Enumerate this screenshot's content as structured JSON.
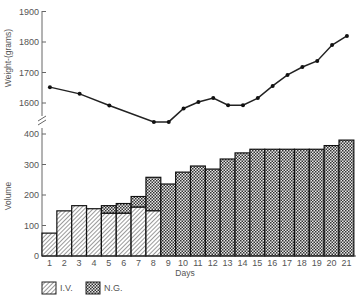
{
  "chart_data": [
    {
      "type": "line",
      "title": "",
      "xlabel": "Days",
      "ylabel": "Weight (grams)",
      "ylim": [
        1500,
        1900
      ],
      "y_ticks": [
        1600,
        1700,
        1800,
        1900
      ],
      "x": [
        1,
        3,
        5,
        8,
        9,
        10,
        11,
        12,
        13,
        14,
        15,
        16,
        17,
        18,
        19,
        20,
        21
      ],
      "values": [
        1652,
        1630,
        1592,
        1538,
        1538,
        1582,
        1603,
        1616,
        1593,
        1593,
        1616,
        1656,
        1692,
        1718,
        1738,
        1790,
        1820
      ],
      "axis_break": true,
      "grid": false
    },
    {
      "type": "bar",
      "stacked": true,
      "title": "",
      "xlabel": "Days",
      "ylabel": "Volume",
      "ylim": [
        0,
        400
      ],
      "y_ticks": [
        0,
        100,
        200,
        300,
        400
      ],
      "categories": [
        "1",
        "2",
        "3",
        "4",
        "5",
        "6",
        "7",
        "8",
        "9",
        "10",
        "11",
        "12",
        "13",
        "14",
        "15",
        "16",
        "17",
        "18",
        "19",
        "20",
        "21"
      ],
      "series": [
        {
          "name": "I.V.",
          "pattern": "diagonal-hatch",
          "values": [
            75,
            148,
            165,
            155,
            140,
            140,
            160,
            148,
            0,
            0,
            0,
            0,
            0,
            0,
            0,
            0,
            0,
            0,
            0,
            0,
            0
          ]
        },
        {
          "name": "N.G.",
          "pattern": "checker",
          "values": [
            0,
            0,
            0,
            0,
            25,
            32,
            35,
            110,
            236,
            275,
            295,
            285,
            318,
            338,
            350,
            350,
            350,
            350,
            350,
            362,
            380
          ]
        }
      ],
      "legend": {
        "position": "bottom-left",
        "entries": [
          "I.V.",
          "N.G."
        ]
      },
      "grid": false
    }
  ],
  "labels": {
    "weight_axis": "Weight-(grams)",
    "volume_axis": "Volume",
    "x_axis": "Days",
    "legend_iv": "I.V.",
    "legend_ng": "N.G."
  }
}
